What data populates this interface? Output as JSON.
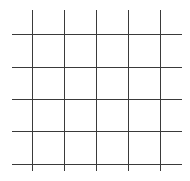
{
  "diagram": {
    "type": "grid",
    "line_color": "#3a3a3a",
    "background_color": "#ffffff",
    "line_width": 1,
    "vertical_lines": {
      "count": 5,
      "x_positions": [
        32,
        64,
        96,
        128,
        160
      ],
      "y_start": 10,
      "y_end": 171
    },
    "horizontal_lines": {
      "count": 5,
      "y_positions": [
        34,
        67,
        99,
        131,
        164
      ],
      "x_start": 12,
      "x_end": 182
    }
  }
}
